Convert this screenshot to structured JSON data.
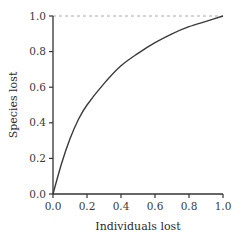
{
  "chart_data": {
    "type": "line",
    "title": "",
    "xlabel": "Individuals lost",
    "ylabel": "Species lost",
    "xlim": [
      0.0,
      1.0
    ],
    "ylim": [
      0.0,
      1.0
    ],
    "grid": false,
    "legend": null,
    "x_ticks": [
      "0.0",
      "0.2",
      "0.4",
      "0.6",
      "0.8",
      "1.0"
    ],
    "y_ticks": [
      "0.0",
      "0.2",
      "0.4",
      "0.6",
      "0.8",
      "1.0"
    ],
    "series": [
      {
        "name": "species-lost-curve",
        "style": "solid",
        "color": "#3a3a3a",
        "x": [
          0.0,
          0.05,
          0.1,
          0.15,
          0.2,
          0.3,
          0.4,
          0.5,
          0.6,
          0.7,
          0.8,
          0.9,
          1.0
        ],
        "y": [
          0.0,
          0.17,
          0.31,
          0.42,
          0.5,
          0.62,
          0.72,
          0.79,
          0.85,
          0.9,
          0.94,
          0.97,
          1.0
        ]
      }
    ],
    "annotations": [
      {
        "type": "horizontal-reference-line",
        "y": 1.0,
        "style": "dashed",
        "color": "#aaaaaa"
      }
    ]
  }
}
